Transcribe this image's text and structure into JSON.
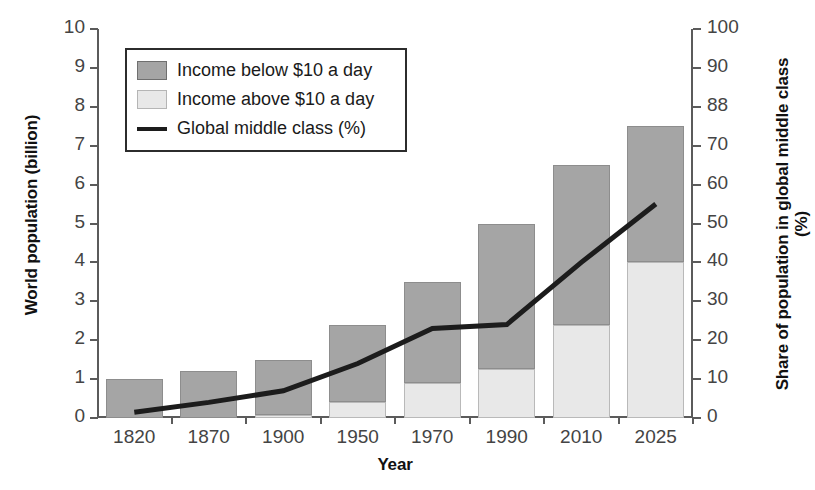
{
  "chart_data": {
    "type": "bar",
    "title": "",
    "xlabel": "Year",
    "ylabel": "World population (billion)",
    "ylabel_right": "Share of population in global middle class (%)",
    "categories": [
      "1820",
      "1870",
      "1900",
      "1950",
      "1970",
      "1990",
      "2010",
      "2025"
    ],
    "ylim": [
      0,
      10
    ],
    "ylim_right": [
      0,
      100
    ],
    "yticks": [
      "10",
      "9",
      "8",
      "7",
      "6",
      "5",
      "4",
      "3",
      "2",
      "1",
      "0"
    ],
    "yticks_right": [
      "100",
      "90",
      "88",
      "70",
      "60",
      "50",
      "40",
      "30",
      "20",
      "10",
      "0"
    ],
    "grid": false,
    "legend_position": "upper-left",
    "series": [
      {
        "name": "Income above $10 a day",
        "axis": "left",
        "unit": "billion",
        "color": "#e8e8e8",
        "values": [
          0,
          0,
          0.08,
          0.4,
          0.9,
          1.25,
          2.4,
          4.0
        ]
      },
      {
        "name": "Income below $10 a day",
        "axis": "left",
        "unit": "billion",
        "color": "#a5a5a5",
        "values": [
          1.0,
          1.2,
          1.42,
          2.0,
          2.6,
          3.75,
          4.1,
          3.5
        ]
      },
      {
        "name": "Global middle class (%)",
        "axis": "right",
        "unit": "percent",
        "color": "#1c1c1c",
        "values": [
          1.5,
          4,
          7,
          14,
          23,
          24,
          40,
          55
        ]
      }
    ],
    "totals": [
      1.0,
      1.2,
      1.5,
      2.4,
      3.5,
      5.0,
      6.5,
      7.5
    ]
  },
  "legend": {
    "items": [
      {
        "label": "Income below $10 a day",
        "icon": "square-dark-swatch"
      },
      {
        "label": "Income above $10 a day",
        "icon": "square-light-swatch"
      },
      {
        "label": "Global middle class (%)",
        "icon": "line-swatch"
      }
    ]
  }
}
